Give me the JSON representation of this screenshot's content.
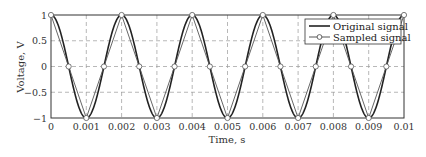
{
  "chart_data": {
    "type": "line",
    "title": "",
    "xlabel": "Time, s",
    "ylabel": "Voltage, V",
    "xlim": [
      0,
      0.01
    ],
    "ylim": [
      -1,
      1
    ],
    "grid": true,
    "legend_position": "upper right",
    "x_ticks": [
      "0",
      "0.001",
      "0.002",
      "0.003",
      "0.004",
      "0.005",
      "0.006",
      "0.007",
      "0.008",
      "0.009",
      "0.01"
    ],
    "y_ticks": [
      "1",
      "0.5",
      "0",
      "-0.5",
      "-1"
    ],
    "series": [
      {
        "name": "Original signal",
        "style": "solid line",
        "function": "cos(2*pi*500*t)",
        "frequency_hz": 500
      },
      {
        "name": "Sampled signal",
        "style": "line with open circle markers",
        "sample_interval_s": 0.0005,
        "x": [
          0,
          0.0005,
          0.001,
          0.0015,
          0.002,
          0.0025,
          0.003,
          0.0035,
          0.004,
          0.0045,
          0.005,
          0.0055,
          0.006,
          0.0065,
          0.007,
          0.0075,
          0.008,
          0.0085,
          0.009,
          0.0095,
          0.01
        ],
        "values": [
          1,
          0,
          -1,
          0,
          1,
          0,
          -1,
          0,
          1,
          0,
          -1,
          0,
          1,
          0,
          -1,
          0,
          1,
          0,
          -1,
          0,
          1
        ]
      }
    ]
  }
}
